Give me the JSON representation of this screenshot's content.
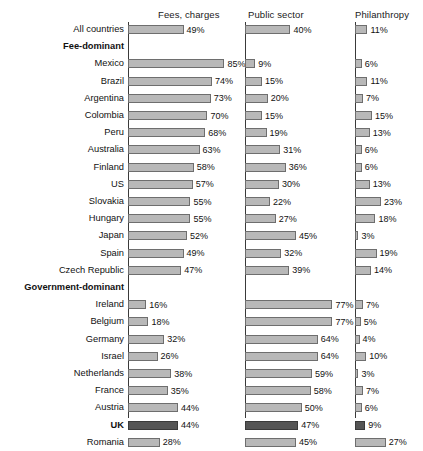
{
  "chart_data": {
    "type": "bar",
    "title": "",
    "subtitle": "",
    "xlabel": "",
    "ylabel": "",
    "grid": false,
    "legend_position": "none",
    "orientation": "horizontal",
    "value_suffix": "%",
    "xlim": [
      0,
      100
    ],
    "series": [
      {
        "name": "Fees, charges",
        "values": [
          49,
          null,
          85,
          74,
          73,
          70,
          68,
          63,
          58,
          57,
          55,
          55,
          52,
          49,
          47,
          null,
          16,
          18,
          32,
          26,
          38,
          35,
          44,
          44,
          28
        ]
      },
      {
        "name": "Public sector",
        "values": [
          40,
          null,
          9,
          15,
          20,
          15,
          19,
          31,
          36,
          30,
          22,
          27,
          45,
          32,
          39,
          null,
          77,
          77,
          64,
          64,
          59,
          58,
          50,
          47,
          45
        ]
      },
      {
        "name": "Philanthropy",
        "values": [
          11,
          null,
          6,
          11,
          7,
          15,
          13,
          6,
          6,
          13,
          23,
          18,
          3,
          19,
          14,
          null,
          7,
          5,
          4,
          10,
          3,
          7,
          6,
          9,
          27
        ]
      }
    ],
    "categories": [
      "All countries",
      "Fee-dominant",
      "Mexico",
      "Brazil",
      "Argentina",
      "Colombia",
      "Peru",
      "Australia",
      "Finland",
      "US",
      "Slovakia",
      "Hungary",
      "Japan",
      "Spain",
      "Czech Republic",
      "Government-dominant",
      "Ireland",
      "Belgium",
      "Germany",
      "Israel",
      "Netherlands",
      "France",
      "Austria",
      "UK",
      "Romania"
    ],
    "highlighted_category": "UK",
    "section_headers": [
      "Fee-dominant",
      "Government-dominant"
    ],
    "colors": {
      "bar_fill": "#b8b8b8",
      "bar_border": "#6e6e6e",
      "bar_fill_highlight": "#555555",
      "bar_border_highlight": "#3a3a3a",
      "axis": "#3a3a3a",
      "text": "#111111",
      "background": "#ffffff"
    }
  },
  "headers": [
    {
      "label": "Fees, charges"
    },
    {
      "label": "Public sector"
    },
    {
      "label": "Philanthropy"
    }
  ],
  "rows": [
    {
      "label": "All countries",
      "kind": "data",
      "values": [
        49,
        40,
        11
      ],
      "value_labels": [
        "49%",
        "40%",
        "11%"
      ]
    },
    {
      "label": "Fee-dominant",
      "kind": "section",
      "values": [
        null,
        null,
        null
      ],
      "value_labels": [
        "",
        "",
        ""
      ]
    },
    {
      "label": "Mexico",
      "kind": "data",
      "values": [
        85,
        9,
        6
      ],
      "value_labels": [
        "85%",
        "9%",
        "6%"
      ]
    },
    {
      "label": "Brazil",
      "kind": "data",
      "values": [
        74,
        15,
        11
      ],
      "value_labels": [
        "74%",
        "15%",
        "11%"
      ]
    },
    {
      "label": "Argentina",
      "kind": "data",
      "values": [
        73,
        20,
        7
      ],
      "value_labels": [
        "73%",
        "20%",
        "7%"
      ]
    },
    {
      "label": "Colombia",
      "kind": "data",
      "values": [
        70,
        15,
        15
      ],
      "value_labels": [
        "70%",
        "15%",
        "15%"
      ]
    },
    {
      "label": "Peru",
      "kind": "data",
      "values": [
        68,
        19,
        13
      ],
      "value_labels": [
        "68%",
        "19%",
        "13%"
      ]
    },
    {
      "label": "Australia",
      "kind": "data",
      "values": [
        63,
        31,
        6
      ],
      "value_labels": [
        "63%",
        "31%",
        "6%"
      ]
    },
    {
      "label": "Finland",
      "kind": "data",
      "values": [
        58,
        36,
        6
      ],
      "value_labels": [
        "58%",
        "36%",
        "6%"
      ]
    },
    {
      "label": "US",
      "kind": "data",
      "values": [
        57,
        30,
        13
      ],
      "value_labels": [
        "57%",
        "30%",
        "13%"
      ]
    },
    {
      "label": "Slovakia",
      "kind": "data",
      "values": [
        55,
        22,
        23
      ],
      "value_labels": [
        "55%",
        "22%",
        "23%"
      ]
    },
    {
      "label": "Hungary",
      "kind": "data",
      "values": [
        55,
        27,
        18
      ],
      "value_labels": [
        "55%",
        "27%",
        "18%"
      ]
    },
    {
      "label": "Japan",
      "kind": "data",
      "values": [
        52,
        45,
        3
      ],
      "value_labels": [
        "52%",
        "45%",
        "3%"
      ]
    },
    {
      "label": "Spain",
      "kind": "data",
      "values": [
        49,
        32,
        19
      ],
      "value_labels": [
        "49%",
        "32%",
        "19%"
      ]
    },
    {
      "label": "Czech Republic",
      "kind": "data",
      "values": [
        47,
        39,
        14
      ],
      "value_labels": [
        "47%",
        "39%",
        "14%"
      ]
    },
    {
      "label": "Government-dominant",
      "kind": "section",
      "values": [
        null,
        null,
        null
      ],
      "value_labels": [
        "",
        "",
        ""
      ]
    },
    {
      "label": "Ireland",
      "kind": "data",
      "values": [
        16,
        77,
        7
      ],
      "value_labels": [
        "16%",
        "77%",
        "7%"
      ]
    },
    {
      "label": "Belgium",
      "kind": "data",
      "values": [
        18,
        77,
        5
      ],
      "value_labels": [
        "18%",
        "77%",
        "5%"
      ]
    },
    {
      "label": "Germany",
      "kind": "data",
      "values": [
        32,
        64,
        4
      ],
      "value_labels": [
        "32%",
        "64%",
        "4%"
      ]
    },
    {
      "label": "Israel",
      "kind": "data",
      "values": [
        26,
        64,
        10
      ],
      "value_labels": [
        "26%",
        "64%",
        "10%"
      ]
    },
    {
      "label": "Netherlands",
      "kind": "data",
      "values": [
        38,
        59,
        3
      ],
      "value_labels": [
        "38%",
        "59%",
        "3%"
      ]
    },
    {
      "label": "France",
      "kind": "data",
      "values": [
        35,
        58,
        7
      ],
      "value_labels": [
        "35%",
        "58%",
        "7%"
      ]
    },
    {
      "label": "Austria",
      "kind": "data",
      "values": [
        44,
        50,
        6
      ],
      "value_labels": [
        "44%",
        "50%",
        "6%"
      ]
    },
    {
      "label": "UK",
      "kind": "data",
      "highlight": true,
      "values": [
        44,
        47,
        9
      ],
      "value_labels": [
        "44%",
        "47%",
        "9%"
      ]
    },
    {
      "label": "Romania",
      "kind": "data",
      "values": [
        28,
        45,
        27
      ],
      "value_labels": [
        "28%",
        "45%",
        "27%"
      ]
    }
  ]
}
